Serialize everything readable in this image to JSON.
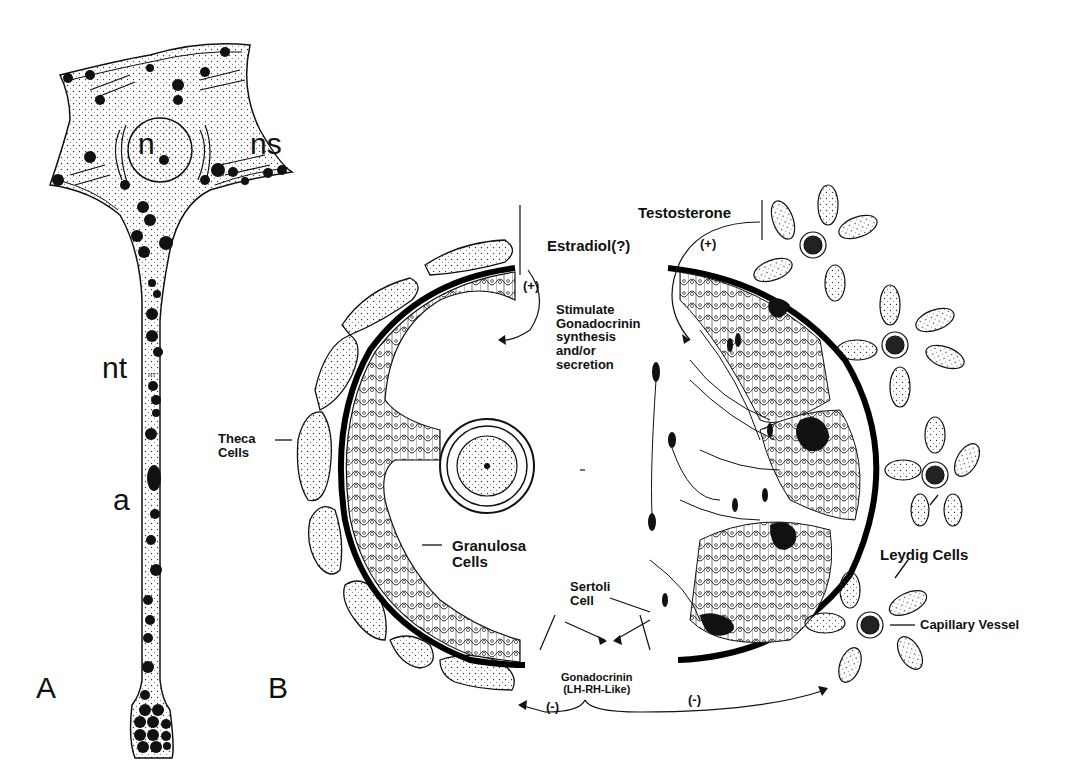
{
  "panel_a": {
    "panel_label": "A",
    "labels": {
      "nucleus": "n",
      "neurosecretory_soma": "ns",
      "nerve_tract": "nt",
      "axon": "a",
      "inner_tract_mark": "NT"
    }
  },
  "panel_b": {
    "panel_label": "B",
    "labels": {
      "estradiol": "Estradiol(?)",
      "estradiol_effect": "(+)",
      "stimulate": "Stimulate\nGonadocrinin\nsynthesis\nand/or\nsecretion",
      "testosterone": "Testosterone",
      "testosterone_effect": "(+)",
      "theca": "Theca\nCells",
      "granulosa": "Granulosa\nCells",
      "sertoli": "Sertoli\nCell",
      "gonadocrinin": "Gonadocrinin\n(LH-RH-Like)",
      "inhibit_left": "(-)",
      "inhibit_right": "(-)",
      "leydig": "Leydig Cells",
      "capillary": "Capillary Vessel"
    }
  }
}
